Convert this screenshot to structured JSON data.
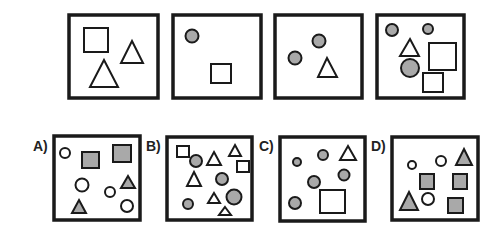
{
  "puzzle": {
    "stroke_color": "#1a1a1a",
    "fill_gray": "#a9a9a9",
    "sequence": [
      {
        "id": "seq-1",
        "box": [
          69,
          15,
          89,
          83
        ],
        "shapes": [
          {
            "type": "square",
            "fill": "none",
            "x": 84,
            "y": 28,
            "w": 24,
            "h": 24
          },
          {
            "type": "triangle",
            "fill": "none",
            "pts": [
              [
                132,
                41
              ],
              [
                143,
                63
              ],
              [
                121,
                63
              ]
            ]
          },
          {
            "type": "triangle",
            "fill": "none",
            "pts": [
              [
                104,
                60
              ],
              [
                118,
                87
              ],
              [
                90,
                87
              ]
            ]
          }
        ]
      },
      {
        "id": "seq-2",
        "box": [
          173,
          15,
          88,
          83
        ],
        "shapes": [
          {
            "type": "circle",
            "fill": "gray",
            "cx": 192,
            "cy": 36,
            "r": 6.5
          },
          {
            "type": "square",
            "fill": "none",
            "x": 211,
            "y": 64,
            "w": 20,
            "h": 19
          }
        ]
      },
      {
        "id": "seq-3",
        "box": [
          275,
          15,
          87,
          83
        ],
        "shapes": [
          {
            "type": "circle",
            "fill": "gray",
            "cx": 319,
            "cy": 41,
            "r": 6.5
          },
          {
            "type": "circle",
            "fill": "gray",
            "cx": 295,
            "cy": 58,
            "r": 6.5
          },
          {
            "type": "triangle",
            "fill": "none",
            "pts": [
              [
                327,
                58
              ],
              [
                337,
                77
              ],
              [
                318,
                77
              ]
            ]
          }
        ]
      },
      {
        "id": "seq-4",
        "box": [
          377,
          15,
          87,
          83
        ],
        "shapes": [
          {
            "type": "circle",
            "fill": "gray",
            "cx": 392,
            "cy": 30,
            "r": 6
          },
          {
            "type": "circle",
            "fill": "gray",
            "cx": 428,
            "cy": 29,
            "r": 5
          },
          {
            "type": "triangle",
            "fill": "none",
            "pts": [
              [
                410,
                39
              ],
              [
                419,
                56
              ],
              [
                400,
                56
              ]
            ]
          },
          {
            "type": "circle",
            "fill": "gray",
            "cx": 410,
            "cy": 68,
            "r": 9
          },
          {
            "type": "square",
            "fill": "none",
            "x": 429,
            "y": 43,
            "w": 27,
            "h": 27
          },
          {
            "type": "square",
            "fill": "none",
            "x": 423,
            "y": 73,
            "w": 20,
            "h": 19
          }
        ]
      }
    ],
    "options": [
      {
        "label": "A)",
        "label_pos": [
          33,
          151
        ],
        "box": [
          54,
          136,
          86,
          84
        ],
        "shapes": [
          {
            "type": "circle",
            "fill": "none",
            "cx": 65,
            "cy": 153,
            "r": 5
          },
          {
            "type": "square",
            "fill": "gray",
            "x": 82,
            "y": 152,
            "w": 17,
            "h": 16
          },
          {
            "type": "square",
            "fill": "gray",
            "x": 113,
            "y": 145,
            "w": 18,
            "h": 17
          },
          {
            "type": "circle",
            "fill": "none",
            "cx": 82,
            "cy": 185,
            "r": 6.5
          },
          {
            "type": "circle",
            "fill": "none",
            "cx": 110,
            "cy": 192,
            "r": 5
          },
          {
            "type": "triangle",
            "fill": "gray",
            "pts": [
              [
                128,
                176
              ],
              [
                135,
                188
              ],
              [
                121,
                188
              ]
            ]
          },
          {
            "type": "triangle",
            "fill": "gray",
            "pts": [
              [
                79,
                200
              ],
              [
                86,
                213
              ],
              [
                72,
                213
              ]
            ]
          },
          {
            "type": "circle",
            "fill": "none",
            "cx": 127,
            "cy": 206,
            "r": 6
          }
        ]
      },
      {
        "label": "B)",
        "label_pos": [
          146,
          151
        ],
        "box": [
          167,
          137,
          85,
          83
        ],
        "shapes": [
          {
            "type": "square",
            "fill": "none",
            "x": 177,
            "y": 146,
            "w": 12,
            "h": 11
          },
          {
            "type": "circle",
            "fill": "gray",
            "cx": 196,
            "cy": 161,
            "r": 6
          },
          {
            "type": "triangle",
            "fill": "none",
            "pts": [
              [
                214,
                152
              ],
              [
                221,
                165
              ],
              [
                207,
                165
              ]
            ]
          },
          {
            "type": "triangle",
            "fill": "none",
            "pts": [
              [
                235,
                145
              ],
              [
                241,
                156
              ],
              [
                229,
                156
              ]
            ]
          },
          {
            "type": "square",
            "fill": "none",
            "x": 237,
            "y": 161,
            "w": 12,
            "h": 11
          },
          {
            "type": "triangle",
            "fill": "none",
            "pts": [
              [
                194,
                172
              ],
              [
                201,
                186
              ],
              [
                187,
                186
              ]
            ]
          },
          {
            "type": "circle",
            "fill": "gray",
            "cx": 222,
            "cy": 179,
            "r": 6
          },
          {
            "type": "triangle",
            "fill": "none",
            "pts": [
              [
                214,
                193
              ],
              [
                220,
                203
              ],
              [
                208,
                203
              ]
            ]
          },
          {
            "type": "circle",
            "fill": "gray",
            "cx": 234,
            "cy": 197,
            "r": 7.5
          },
          {
            "type": "circle",
            "fill": "gray",
            "cx": 188,
            "cy": 204,
            "r": 5
          },
          {
            "type": "triangle",
            "fill": "none",
            "pts": [
              [
                225,
                207
              ],
              [
                231,
                215
              ],
              [
                219,
                215
              ]
            ]
          }
        ]
      },
      {
        "label": "C)",
        "label_pos": [
          259,
          151
        ],
        "box": [
          280,
          137,
          85,
          84
        ],
        "shapes": [
          {
            "type": "circle",
            "fill": "gray",
            "cx": 297,
            "cy": 162,
            "r": 4
          },
          {
            "type": "circle",
            "fill": "gray",
            "cx": 323,
            "cy": 155,
            "r": 5
          },
          {
            "type": "triangle",
            "fill": "none",
            "pts": [
              [
                348,
                146
              ],
              [
                356,
                160
              ],
              [
                340,
                160
              ]
            ]
          },
          {
            "type": "circle",
            "fill": "gray",
            "cx": 344,
            "cy": 175,
            "r": 5.5
          },
          {
            "type": "circle",
            "fill": "gray",
            "cx": 314,
            "cy": 182,
            "r": 6
          },
          {
            "type": "circle",
            "fill": "gray",
            "cx": 295,
            "cy": 203,
            "r": 6
          },
          {
            "type": "square",
            "fill": "none",
            "x": 320,
            "y": 190,
            "w": 25,
            "h": 23
          }
        ]
      },
      {
        "label": "D)",
        "label_pos": [
          371,
          151
        ],
        "box": [
          392,
          137,
          86,
          83
        ],
        "shapes": [
          {
            "type": "circle",
            "fill": "none",
            "cx": 412,
            "cy": 165,
            "r": 4
          },
          {
            "type": "circle",
            "fill": "none",
            "cx": 441,
            "cy": 161,
            "r": 5
          },
          {
            "type": "triangle",
            "fill": "gray",
            "pts": [
              [
                464,
                149
              ],
              [
                472,
                165
              ],
              [
                456,
                165
              ]
            ]
          },
          {
            "type": "square",
            "fill": "gray",
            "x": 420,
            "y": 174,
            "w": 14,
            "h": 15
          },
          {
            "type": "square",
            "fill": "gray",
            "x": 453,
            "y": 174,
            "w": 14,
            "h": 15
          },
          {
            "type": "triangle",
            "fill": "gray",
            "pts": [
              [
                409,
                192
              ],
              [
                418,
                210
              ],
              [
                400,
                210
              ]
            ]
          },
          {
            "type": "circle",
            "fill": "none",
            "cx": 428,
            "cy": 199,
            "r": 6
          },
          {
            "type": "square",
            "fill": "gray",
            "x": 448,
            "y": 198,
            "w": 15,
            "h": 15
          }
        ]
      }
    ]
  }
}
